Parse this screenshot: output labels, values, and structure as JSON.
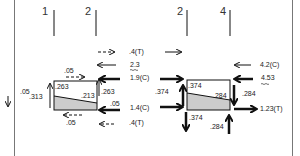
{
  "diagram": {
    "type": "free-body-diagram",
    "colors": {
      "line": "#111111",
      "fill": "#cccccc",
      "border": "#777777"
    },
    "joint_labels": [
      {
        "id": "j1",
        "text": "1"
      },
      {
        "id": "j2a",
        "text": "2"
      },
      {
        "id": "j2b",
        "text": "2"
      },
      {
        "id": "j4",
        "text": "4"
      }
    ],
    "left_element": {
      "stress_top_left": ".263",
      "stress_mid_right": ".213",
      "shear_top": ".05",
      "shear_bottom": ".05",
      "left_side_upper": ".05",
      "left_side_lower": ".313",
      "right_side_upper": ".263",
      "right_side_lower": ".05",
      "right_forces": [
        {
          "label": ".4(T)",
          "style": "dashed",
          "direction": "right"
        },
        {
          "label": "2.3",
          "style": "thin",
          "direction": "left",
          "note": "wavy underline"
        },
        {
          "label": "1.9(C)",
          "style": "bold",
          "direction": "left"
        },
        {
          "label": "1.4(C)",
          "style": "bold",
          "direction": "left"
        },
        {
          "label": ".4(T)",
          "style": "dashed",
          "direction": "left"
        }
      ]
    },
    "right_element": {
      "stress_top_left": ".374",
      "stress_mid_right": ".284",
      "left_side": ".374",
      "right_side": ".284",
      "bottom_left": ".374",
      "bottom_right": ".284",
      "right_forces": [
        {
          "label": "4.2(C)",
          "style": "thin",
          "direction": "left"
        },
        {
          "label": "4.53",
          "style": "bold",
          "direction": "left",
          "note": "wavy underline"
        },
        {
          "label": "1.23(T)",
          "style": "bold",
          "direction": "right"
        }
      ]
    }
  }
}
